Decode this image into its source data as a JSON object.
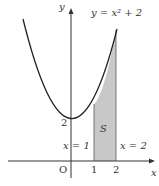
{
  "figure": {
    "curve_label": "y = x² + 2",
    "y_axis_label": "y",
    "x_axis_label": "x",
    "origin_label": "O",
    "tick_x1": "1",
    "tick_x2": "2",
    "tick_y2": "2",
    "line1_label": "x = 1",
    "line2_label": "x = 2",
    "region_label": "S",
    "colors": {
      "curve": "#222222",
      "region_fill": "#c8c8c8",
      "axis": "#333333"
    }
  }
}
